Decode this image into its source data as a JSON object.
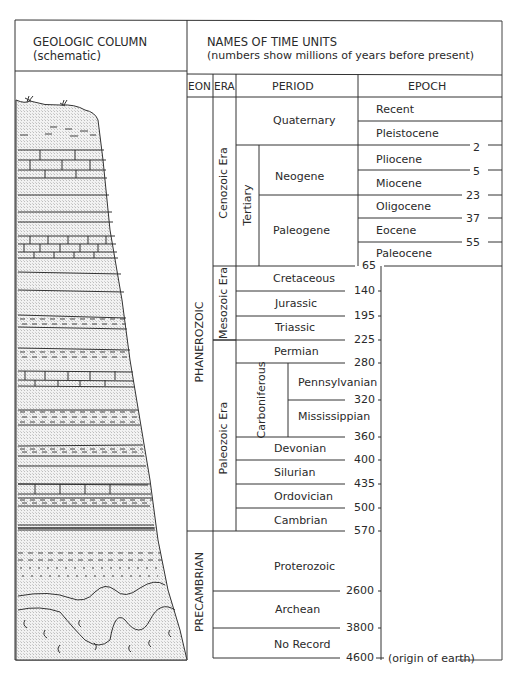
{
  "left_header": {
    "title": "GEOLOGIC COLUMN",
    "subtitle": "(schematic)"
  },
  "right_header": {
    "title": "NAMES OF TIME UNITS",
    "subtitle": "(numbers show millions of years before present)"
  },
  "columns": {
    "eon": "EON",
    "era": "ERA",
    "period": "PERIOD",
    "epoch": "EPOCH"
  },
  "eons": {
    "phanerozoic": "PHANEROZOIC",
    "precambrian": "PRECAMBRIAN"
  },
  "eras": {
    "cenozoic": "Cenozoic Era",
    "mesozoic": "Mesozoic Era",
    "paleozoic": "Paleozoic Era"
  },
  "subperiods": {
    "tertiary": "Tertiary",
    "carboniferous": "Carboniferous"
  },
  "periods": {
    "quaternary": "Quaternary",
    "neogene": "Neogene",
    "paleogene": "Paleogene",
    "cretaceous": "Cretaceous",
    "jurassic": "Jurassic",
    "triassic": "Triassic",
    "permian": "Permian",
    "pennsylvanian": "Pennsylvanian",
    "mississippian": "Mississippian",
    "devonian": "Devonian",
    "silurian": "Silurian",
    "ordovician": "Ordovician",
    "cambrian": "Cambrian",
    "proterozoic": "Proterozoic",
    "archean": "Archean",
    "no_record": "No Record"
  },
  "epochs": [
    "Recent",
    "Pleistocene",
    "Pliocene",
    "Miocene",
    "Oligocene",
    "Eocene",
    "Paleocene"
  ],
  "boundaries": {
    "b2": "2",
    "b5": "5",
    "b23": "23",
    "b37": "37",
    "b55": "55",
    "b65": "65",
    "b140": "140",
    "b195": "195",
    "b225": "225",
    "b280": "280",
    "b320": "320",
    "b360": "360",
    "b400": "400",
    "b435": "435",
    "b500": "500",
    "b570": "570",
    "b2600": "2600",
    "b3800": "3800",
    "b4600": "4600"
  },
  "origin_note": "(origin of earth)"
}
